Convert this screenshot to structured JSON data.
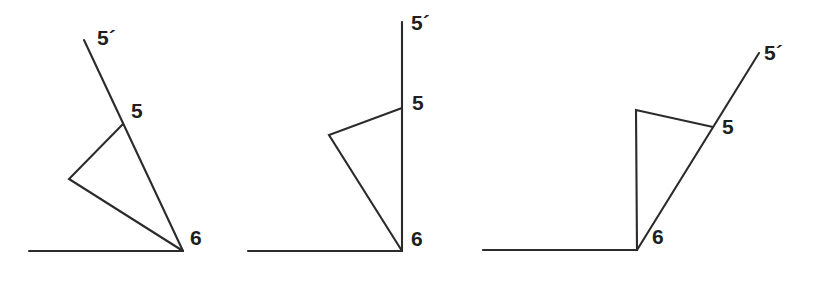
{
  "figure": {
    "background_color": "#ffffff",
    "stroke_color": "#2b2b2b",
    "label_color": "#1f1f1f",
    "width": 814,
    "height": 284,
    "panel_count": 3
  },
  "chart_data": {
    "type": "diagram",
    "xlabel": "",
    "ylabel": "",
    "grid": false,
    "legend": "none",
    "xlim": [
      0,
      814
    ],
    "ylim": [
      0,
      284
    ],
    "panels": [
      {
        "name": "panel-1",
        "baseline": {
          "x1": 29,
          "y1": 251,
          "x2": 183,
          "y2": 251
        },
        "ray": {
          "x1": 183,
          "y1": 251,
          "x2": 84,
          "y2": 40
        },
        "ray_point_5": {
          "x": 123,
          "y": 124
        },
        "flap": [
          {
            "x": 123,
            "y": 124
          },
          {
            "x": 69,
            "y": 179
          },
          {
            "x": 183,
            "y": 251
          }
        ],
        "labels": [
          {
            "text": "5´",
            "x": 97,
            "y": 27
          },
          {
            "text": "5",
            "x": 131,
            "y": 100
          },
          {
            "text": "6",
            "x": 190,
            "y": 227
          }
        ]
      },
      {
        "name": "panel-2",
        "baseline": {
          "x1": 248,
          "y1": 251,
          "x2": 402,
          "y2": 251
        },
        "ray": {
          "x1": 402,
          "y1": 251,
          "x2": 402,
          "y2": 22
        },
        "ray_point_5": {
          "x": 402,
          "y": 108
        },
        "flap": [
          {
            "x": 402,
            "y": 108
          },
          {
            "x": 329,
            "y": 135
          },
          {
            "x": 402,
            "y": 251
          }
        ],
        "labels": [
          {
            "text": "5´",
            "x": 411,
            "y": 12
          },
          {
            "text": "5",
            "x": 412,
            "y": 92
          },
          {
            "text": "6",
            "x": 411,
            "y": 228
          }
        ]
      },
      {
        "name": "panel-3",
        "baseline": {
          "x1": 483,
          "y1": 250,
          "x2": 637,
          "y2": 250
        },
        "ray": {
          "x1": 637,
          "y1": 250,
          "x2": 759,
          "y2": 53
        },
        "ray_point_5": {
          "x": 713,
          "y": 127
        },
        "flap": [
          {
            "x": 713,
            "y": 127
          },
          {
            "x": 636,
            "y": 110
          },
          {
            "x": 637,
            "y": 250
          }
        ],
        "labels": [
          {
            "text": "5´",
            "x": 764,
            "y": 42
          },
          {
            "text": "5",
            "x": 722,
            "y": 116
          },
          {
            "text": "6",
            "x": 652,
            "y": 226
          }
        ]
      }
    ]
  }
}
